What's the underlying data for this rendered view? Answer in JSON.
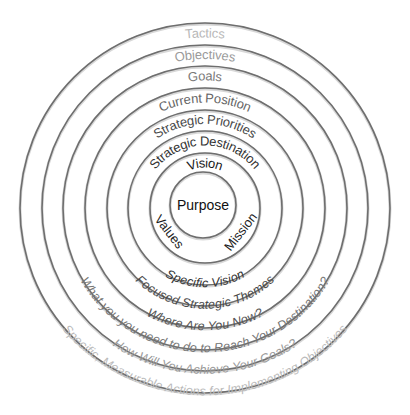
{
  "diagram": {
    "type": "concentric-circles",
    "center": {
      "label": "Purpose",
      "color": "#111111"
    },
    "inner_ring": {
      "top": "Vision",
      "left": "Values",
      "right": "Mission",
      "color": "#1a1a1a"
    },
    "rings": [
      {
        "name": "strategic-destination",
        "top": "Strategic Destination",
        "bottom": "Specific Vision",
        "color": "#333333"
      },
      {
        "name": "strategic-priorities",
        "top": "Strategic Priorities",
        "bottom": "Focused Strategic Themes",
        "color": "#4a4a4a"
      },
      {
        "name": "current-position",
        "top": "Current Position",
        "bottom": "Where Are You Now?",
        "color": "#666666"
      },
      {
        "name": "goals",
        "top": "Goals",
        "bottom": "What you you need to do to Reach Your Destination?",
        "color": "#7a7a7a"
      },
      {
        "name": "objectives",
        "top": "Objectives",
        "bottom": "How Will You Achieve Your Goals?",
        "color": "#9a9a9a"
      },
      {
        "name": "tactics",
        "top": "Tactics",
        "bottom": "Specific, Measurable Actions for Implementing Objectives",
        "color": "#b8b8b8"
      }
    ],
    "ring_stroke_color": "#6e6e6e",
    "background": "#ffffff"
  }
}
